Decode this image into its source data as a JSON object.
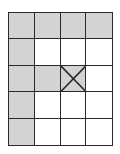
{
  "diagram": {
    "rows": 5,
    "cols": 4,
    "colors": {
      "shaded": "#d3d3d3",
      "empty": "#ffffff",
      "line": "#2a2a2a"
    },
    "cells": [
      [
        "shaded",
        "shaded",
        "shaded",
        "shaded"
      ],
      [
        "shaded",
        "empty",
        "empty",
        "empty"
      ],
      [
        "shaded",
        "shaded",
        "shaded-x",
        "empty"
      ],
      [
        "shaded",
        "empty",
        "empty",
        "empty"
      ],
      [
        "shaded",
        "empty",
        "empty",
        "empty"
      ]
    ],
    "marked_cell": {
      "row": 2,
      "col": 2,
      "mark": "X"
    }
  }
}
